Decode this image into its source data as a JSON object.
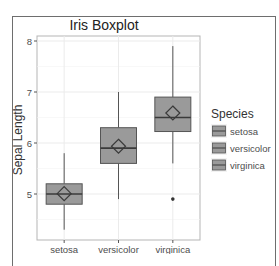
{
  "chart_data": {
    "type": "boxplot",
    "title": "Iris Boxplot",
    "xlabel": "",
    "ylabel": "Sepal Length",
    "categories": [
      "setosa",
      "versicolor",
      "virginica"
    ],
    "yticks": [
      5,
      6,
      7,
      8
    ],
    "ylim": [
      4.2,
      8.1
    ],
    "grid": true,
    "legend": {
      "title": "Species",
      "position": "right",
      "entries": [
        "setosa",
        "versicolor",
        "virginica"
      ]
    },
    "series": [
      {
        "name": "setosa",
        "whisker_low": 4.3,
        "q1": 4.8,
        "median": 5.0,
        "q3": 5.2,
        "whisker_high": 5.8,
        "mean": 5.006,
        "outliers": []
      },
      {
        "name": "versicolor",
        "whisker_low": 4.9,
        "q1": 5.6,
        "median": 5.9,
        "q3": 6.3,
        "whisker_high": 7.0,
        "mean": 5.936,
        "outliers": []
      },
      {
        "name": "virginica",
        "whisker_low": 5.6,
        "q1": 6.225,
        "median": 6.5,
        "q3": 6.9,
        "whisker_high": 7.9,
        "mean": 6.588,
        "outliers": [
          4.9
        ]
      }
    ],
    "colors": {
      "box_fill": "#9a9a9a",
      "box_line": "#555555",
      "grid": "#ebebeb",
      "panel_border": "#b5b5b5",
      "text": "#333333",
      "axis_text": "#4d4d4d"
    }
  }
}
